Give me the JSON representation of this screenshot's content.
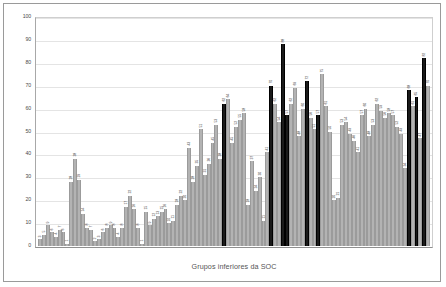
{
  "chart_data": {
    "type": "bar",
    "title": "",
    "xlabel": "Grupos inferiores da SOC",
    "ylabel": "",
    "ylim": [
      0,
      100
    ],
    "yticks": [
      0,
      10,
      20,
      30,
      40,
      50,
      60,
      70,
      80,
      90,
      100
    ],
    "grid": true,
    "legend": "none",
    "series_colors": {
      "low": "#b3b3b3",
      "high": "#1a1a1a"
    },
    "categories": [
      "1",
      "2",
      "3",
      "4",
      "5",
      "6",
      "7",
      "8",
      "9",
      "10",
      "11",
      "12",
      "13",
      "14",
      "15",
      "16",
      "17",
      "18",
      "19",
      "20",
      "21",
      "22",
      "23",
      "24",
      "25",
      "26",
      "27",
      "28",
      "29",
      "30",
      "31",
      "32",
      "33",
      "34",
      "35",
      "36",
      "37",
      "38",
      "39",
      "40",
      "41",
      "42",
      "43",
      "44",
      "45",
      "46",
      "47",
      "48",
      "49",
      "50",
      "51",
      "52",
      "53",
      "54",
      "55",
      "56",
      "57",
      "58",
      "59",
      "60",
      "61",
      "62",
      "63",
      "64",
      "65",
      "66",
      "67",
      "68",
      "69",
      "70",
      "71",
      "72",
      "73",
      "74",
      "75",
      "76",
      "77",
      "78",
      "79",
      "80",
      "81",
      "82",
      "83",
      "84",
      "85",
      "86",
      "87",
      "88",
      "89",
      "90",
      "91",
      "92",
      "93",
      "94",
      "95",
      "96",
      "97",
      "98",
      "99",
      "100"
    ],
    "values": [
      3,
      5,
      9,
      6,
      4,
      7,
      6,
      1,
      28,
      38,
      29,
      14,
      8,
      7,
      2,
      3,
      6,
      8,
      9,
      8,
      4,
      8,
      17,
      22,
      16,
      8,
      1,
      15,
      9,
      12,
      13,
      15,
      16,
      10,
      11,
      18,
      22,
      20,
      43,
      28,
      35,
      51,
      31,
      36,
      45,
      53,
      38,
      62,
      64,
      45,
      52,
      55,
      58,
      18,
      37,
      24,
      30,
      11,
      41,
      70,
      62,
      54,
      88,
      57,
      62,
      69,
      48,
      60,
      72,
      56,
      51,
      57,
      75,
      61,
      50,
      20,
      21,
      53,
      54,
      49,
      46,
      41,
      57,
      60,
      48,
      53,
      62,
      59,
      56,
      58,
      57,
      52,
      49,
      34,
      68,
      61,
      65,
      47,
      82,
      70
    ],
    "colors": [
      "low",
      "low",
      "low",
      "low",
      "low",
      "low",
      "low",
      "low",
      "low",
      "low",
      "low",
      "low",
      "low",
      "low",
      "low",
      "low",
      "low",
      "low",
      "low",
      "low",
      "low",
      "low",
      "low",
      "low",
      "low",
      "low",
      "low",
      "low",
      "low",
      "low",
      "low",
      "low",
      "low",
      "low",
      "low",
      "low",
      "low",
      "low",
      "low",
      "low",
      "low",
      "low",
      "low",
      "low",
      "low",
      "low",
      "low",
      "high",
      "low",
      "low",
      "low",
      "low",
      "low",
      "low",
      "low",
      "low",
      "low",
      "low",
      "low",
      "high",
      "low",
      "low",
      "high",
      "high",
      "low",
      "low",
      "low",
      "low",
      "high",
      "low",
      "low",
      "high",
      "low",
      "low",
      "low",
      "low",
      "low",
      "low",
      "low",
      "low",
      "low",
      "low",
      "low",
      "low",
      "low",
      "low",
      "low",
      "low",
      "low",
      "low",
      "low",
      "low",
      "low",
      "low",
      "high",
      "low",
      "high",
      "low",
      "high",
      "low"
    ],
    "labels": [
      "3",
      "5",
      "9",
      "6",
      "4",
      "7",
      "6",
      "1",
      "28",
      "38",
      "29",
      "14",
      "8",
      "7",
      "2",
      "3",
      "6",
      "8",
      "9",
      "8",
      "4",
      "8",
      "17",
      "22",
      "16",
      "8",
      "1",
      "15",
      "9",
      "12",
      "13",
      "15",
      "16",
      "10",
      "11",
      "18",
      "22",
      "20",
      "43",
      "28",
      "35",
      "51",
      "31",
      "36",
      "45",
      "53",
      "38",
      "62",
      "64",
      "45",
      "52",
      "55",
      "58",
      "18",
      "37",
      "24",
      "30",
      "11",
      "41",
      "70",
      "62",
      "54",
      "88",
      "57",
      "62",
      "69",
      "48",
      "60",
      "72",
      "56",
      "51",
      "57",
      "75",
      "61",
      "50",
      "20",
      "21",
      "53",
      "54",
      "49",
      "46",
      "41",
      "57",
      "60",
      "48",
      "53",
      "62",
      "59",
      "56",
      "58",
      "57",
      "52",
      "49",
      "34",
      "68",
      "61",
      "65",
      "47",
      "82",
      "70"
    ]
  },
  "axes": {
    "x_title": "Grupos inferiores da SOC"
  }
}
